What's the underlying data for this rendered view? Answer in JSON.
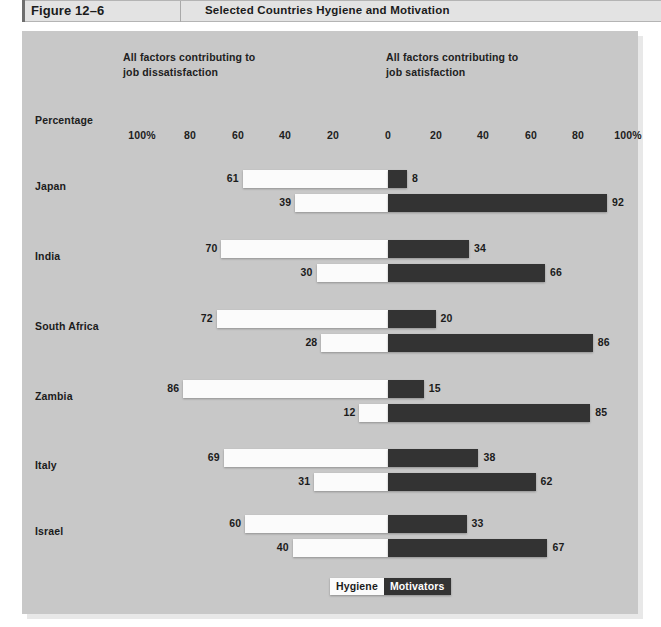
{
  "header": {
    "figure_number": "Figure 12–6",
    "title": "Selected Countries Hygiene and Motivation"
  },
  "captions": {
    "dissatisfaction": "All factors contributing to\njob dissatisfaction",
    "dissatisfaction_line1": "All factors contributing to",
    "dissatisfaction_line2": "job dissatisfaction",
    "satisfaction_line1": "All factors contributing to",
    "satisfaction_line2": "job satisfaction"
  },
  "axis": {
    "title": "Percentage",
    "ticks": [
      "100%",
      "80",
      "60",
      "40",
      "20",
      "0",
      "20",
      "40",
      "60",
      "80",
      "100%"
    ],
    "tick_x": [
      142,
      190,
      238,
      285,
      333,
      388,
      436,
      483,
      531,
      578,
      628
    ]
  },
  "legend": {
    "hygiene": "Hygiene",
    "motivators": "Motivators",
    "hygiene_color": "#fbfbfb",
    "motivators_color": "#333333"
  },
  "colors": {
    "panel_background": "#c8c8c8",
    "header_background": "#e3e3e3",
    "hygiene_bar": "#fbfbfb",
    "motivators_bar": "#333333",
    "text": "#1b1b1b"
  },
  "chart_data": {
    "type": "bar",
    "title": "Selected Countries Hygiene and Motivation",
    "subtitle": "Figure 12–6",
    "orientation": "horizontal-diverging",
    "xlabel": "Percentage",
    "ylabel": "",
    "xlim": [
      -100,
      100
    ],
    "grid": false,
    "legend_position": "bottom-center",
    "left_axis_label": "All factors contributing to job dissatisfaction",
    "right_axis_label": "All factors contributing to job satisfaction",
    "categories": [
      "Japan",
      "India",
      "South Africa",
      "Zambia",
      "Italy",
      "Israel"
    ],
    "series": [
      {
        "name": "Hygiene",
        "color": "#fbfbfb",
        "dissatisfaction": [
          61,
          70,
          72,
          86,
          69,
          60
        ],
        "satisfaction": [
          8,
          34,
          20,
          15,
          38,
          33
        ]
      },
      {
        "name": "Motivators",
        "color": "#333333",
        "dissatisfaction": [
          39,
          30,
          28,
          12,
          31,
          40
        ],
        "satisfaction": [
          92,
          66,
          86,
          85,
          62,
          67
        ]
      }
    ],
    "rows": [
      {
        "country": "Japan",
        "label_y": 180,
        "bars": [
          {
            "series": "Hygiene",
            "left_value": 61,
            "right_value": 8,
            "y": 170
          },
          {
            "series": "Motivators",
            "left_value": 39,
            "right_value": 92,
            "y": 194
          }
        ]
      },
      {
        "country": "India",
        "label_y": 250,
        "bars": [
          {
            "series": "Hygiene",
            "left_value": 70,
            "right_value": 34,
            "y": 240
          },
          {
            "series": "Motivators",
            "left_value": 30,
            "right_value": 66,
            "y": 264
          }
        ]
      },
      {
        "country": "South Africa",
        "label_y": 320,
        "bars": [
          {
            "series": "Hygiene",
            "left_value": 72,
            "right_value": 20,
            "y": 310
          },
          {
            "series": "Motivators",
            "left_value": 28,
            "right_value": 86,
            "y": 334
          }
        ]
      },
      {
        "country": "Zambia",
        "label_y": 390,
        "bars": [
          {
            "series": "Hygiene",
            "left_value": 86,
            "right_value": 15,
            "y": 380
          },
          {
            "series": "Motivators",
            "left_value": 12,
            "right_value": 85,
            "y": 404
          }
        ]
      },
      {
        "country": "Italy",
        "label_y": 459,
        "bars": [
          {
            "series": "Hygiene",
            "left_value": 69,
            "right_value": 38,
            "y": 449
          },
          {
            "series": "Motivators",
            "left_value": 31,
            "right_value": 62,
            "y": 473
          }
        ]
      },
      {
        "country": "Israel",
        "label_y": 525,
        "bars": [
          {
            "series": "Hygiene",
            "left_value": 60,
            "right_value": 33,
            "y": 515
          },
          {
            "series": "Motivators",
            "left_value": 40,
            "right_value": 67,
            "y": 539
          }
        ]
      }
    ]
  }
}
